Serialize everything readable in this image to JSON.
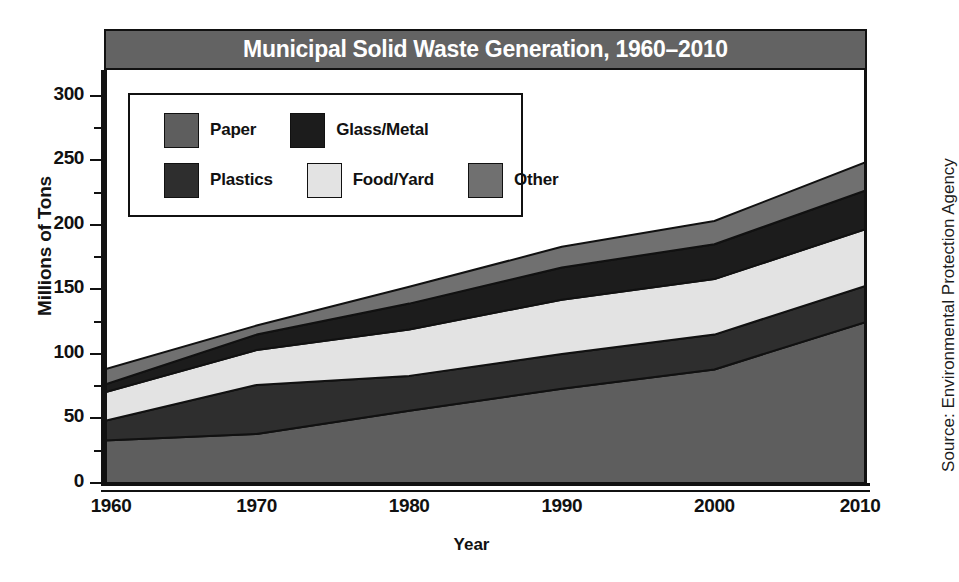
{
  "chart_data": {
    "type": "area",
    "title": "Municipal Solid Waste Generation, 1960–2010",
    "xlabel": "Year",
    "ylabel": "Millions of Tons",
    "source": "Source: Environmental Protection Agency",
    "stacked": true,
    "grid": false,
    "legend_position": "upper-left-inside",
    "xlim": [
      1960,
      2010
    ],
    "ylim": [
      0,
      320
    ],
    "x": [
      1960,
      1970,
      1980,
      1990,
      2000,
      2010
    ],
    "xticks": [
      "1960",
      "1970",
      "1980",
      "1990",
      "2000",
      "2010"
    ],
    "yticks": [
      "0",
      "50",
      "100",
      "150",
      "200",
      "250",
      "300"
    ],
    "ytick_values": [
      0,
      50,
      100,
      150,
      200,
      250,
      300
    ],
    "yminor_step": 25,
    "series": [
      {
        "name": "Paper",
        "color": "#5e5e5e",
        "values": [
          33,
          38,
          56,
          73,
          88,
          125
        ]
      },
      {
        "name": "Plastics",
        "color": "#2e2e2e",
        "values": [
          15,
          38,
          27,
          27,
          27,
          28
        ]
      },
      {
        "name": "Food/Yard",
        "color": "#e3e3e3",
        "values": [
          22,
          27,
          36,
          42,
          43,
          44
        ]
      },
      {
        "name": "Glass/Metal",
        "color": "#1c1c1c",
        "values": [
          6,
          12,
          20,
          25,
          27,
          30
        ]
      },
      {
        "name": "Other",
        "color": "#707070",
        "values": [
          12,
          7,
          13,
          16,
          18,
          22
        ]
      }
    ],
    "cumulative_tops": {
      "Paper": [
        33,
        38,
        56,
        73,
        88,
        125
      ],
      "Plastics": [
        48,
        76,
        83,
        100,
        115,
        153
      ],
      "Food/Yard": [
        70,
        103,
        119,
        142,
        158,
        197
      ],
      "Glass/Metal": [
        76,
        115,
        139,
        167,
        185,
        227
      ],
      "Other": [
        88,
        122,
        152,
        183,
        203,
        249
      ]
    }
  },
  "legend": {
    "rows": [
      [
        {
          "label": "Paper",
          "color": "#5e5e5e"
        },
        {
          "label": "Glass/Metal",
          "color": "#1c1c1c"
        }
      ],
      [
        {
          "label": "Plastics",
          "color": "#2e2e2e"
        },
        {
          "label": "Food/Yard",
          "color": "#e3e3e3"
        },
        {
          "label": "Other",
          "color": "#707070"
        }
      ]
    ]
  },
  "title_bar": {
    "background": "#636363",
    "text_color": "#ffffff"
  }
}
